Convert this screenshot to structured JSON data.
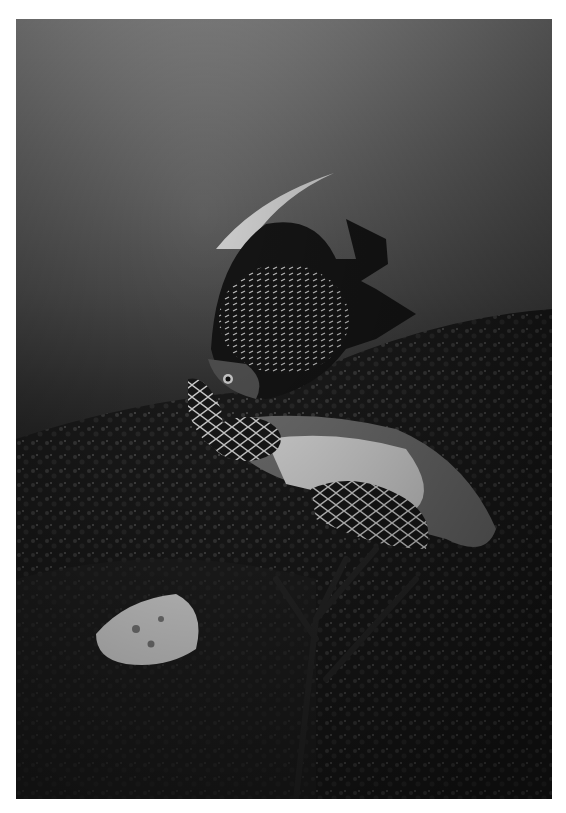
{
  "photo": {
    "style": "black-and-white",
    "subjects": [
      "angelfish",
      "hawksbill-turtle",
      "sponge",
      "coral-reef"
    ],
    "colors": {
      "border": "#ffffff",
      "water_top": "#8a8a8a",
      "water_bottom": "#141414"
    }
  }
}
